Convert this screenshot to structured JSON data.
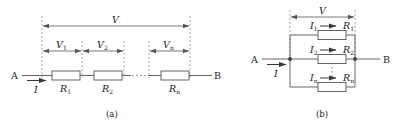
{
  "figure": {
    "colors": {
      "wire": "#555555",
      "dashed": "#777777",
      "resistor_fill": "#ffffff",
      "resistor_stroke": "#555555",
      "text": "#1a1a1a",
      "background": "#ffffff"
    },
    "panels": [
      {
        "id": "a",
        "caption": "(a)",
        "type": "series",
        "terminals": {
          "left": "A",
          "right": "B"
        },
        "current_label": "I",
        "total_voltage_label": "V",
        "voltage_labels": [
          "V",
          "V",
          "V"
        ],
        "voltage_subscripts": [
          "1",
          "2",
          "n"
        ],
        "resistor_labels": [
          "R",
          "R",
          "R"
        ],
        "resistor_subscripts": [
          "1",
          "2",
          "n"
        ],
        "ellipsis": "· · · ·"
      },
      {
        "id": "b",
        "caption": "(b)",
        "type": "parallel",
        "terminals": {
          "left": "A",
          "right": "B"
        },
        "current_label": "I",
        "total_voltage_label": "V",
        "branch_current_labels": [
          "I",
          "I",
          "I"
        ],
        "branch_current_subscripts": [
          "1",
          "2",
          "n"
        ],
        "resistor_labels": [
          "R",
          "R",
          "R"
        ],
        "resistor_subscripts": [
          "1",
          "2",
          "n"
        ]
      }
    ]
  }
}
